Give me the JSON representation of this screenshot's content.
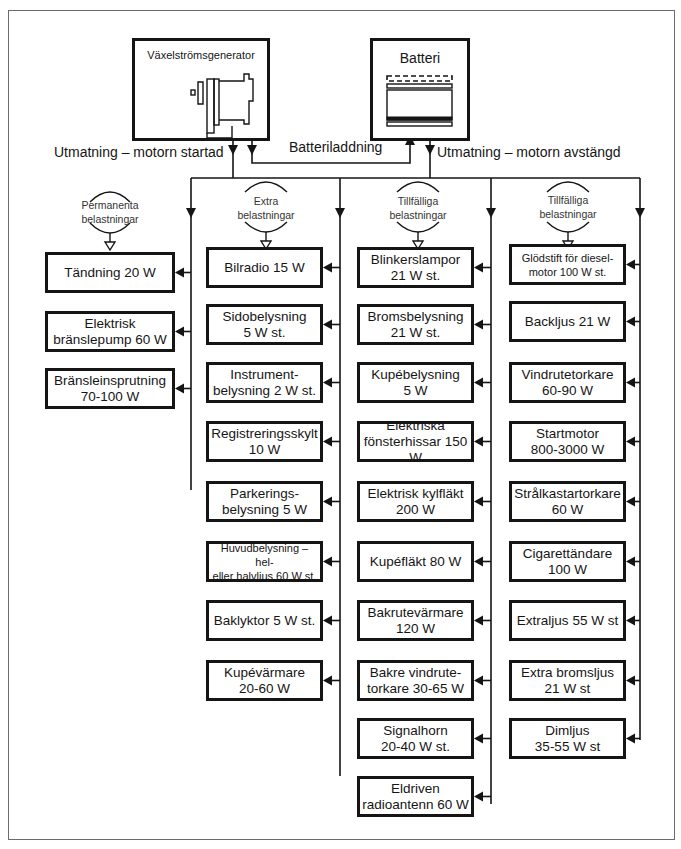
{
  "sources": {
    "generator": {
      "label": "Växelströmsgenerator"
    },
    "battery": {
      "label": "Batteri"
    }
  },
  "flows": {
    "engine_running": "Utmatning – motorn startad",
    "charging": "Batteriladdning",
    "engine_off": "Utmatning – motorn avstängd"
  },
  "groups": [
    {
      "label": "Permanenta\nbelastningar",
      "loads": [
        "Tändning 20 W",
        "Elektrisk\nbränslepump 60 W",
        "Bränsleinsprutning\n70-100 W"
      ]
    },
    {
      "label": "Extra\nbelastningar",
      "loads": [
        "Bilradio 15 W",
        "Sidobelysning\n5 W st.",
        "Instrument-\nbelysning 2 W st.",
        "Registreringsskylt\n10 W",
        "Parkerings-\nbelysning 5 W",
        "Huvudbelysning – hel-\neller halvljus 60 W st.",
        "Baklyktor 5 W st.",
        "Kupévärmare\n20-60 W"
      ]
    },
    {
      "label": "Tillfälliga\nbelastningar",
      "loads": [
        "Blinkerslampor\n21 W st.",
        "Bromsbelysning\n21 W st.",
        "Kupébelysning\n5 W",
        "Elektriska\nfönsterhissar 150 W",
        "Elektrisk kylfläkt\n200 W",
        "Kupéfläkt 80 W",
        "Bakrutevärmare\n120 W",
        "Bakre vindrute-\ntorkare 30-65 W",
        "Signalhorn\n20-40 W st.",
        "Eldriven\nradioantenn 60 W"
      ]
    },
    {
      "label": "Tillfälliga\nbelastningar",
      "loads": [
        "Glödstift för diesel-\nmotor 100 W st.",
        "Backljus 21 W",
        "Vindrutetorkare\n60-90 W",
        "Startmotor\n800-3000 W",
        "Strålkastartorkare\n60 W",
        "Cigarettändare\n100 W",
        "Extraljus 55 W st",
        "Extra bromsljus\n21 W st",
        "Dimljus\n35-55 W st"
      ]
    }
  ]
}
